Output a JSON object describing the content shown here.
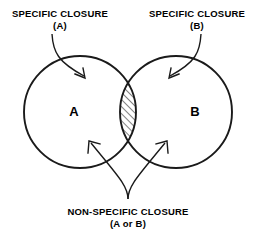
{
  "diagram": {
    "type": "venn-two-set",
    "background_color": "#ffffff",
    "stroke_color": "#1a1a1a",
    "labels": {
      "specific_a_line1": "SPECIFIC CLOSURE",
      "specific_a_line2": "(A)",
      "specific_b_line1": "SPECIFIC CLOSURE",
      "specific_b_line2": "(B)",
      "nonspecific_line1": "NON-SPECIFIC CLOSURE",
      "nonspecific_line2": "(A or B)"
    },
    "sets": {
      "left": {
        "letter": "A",
        "center_x": 80,
        "center_y": 112,
        "radius": 56
      },
      "right": {
        "letter": "B",
        "center_x": 176,
        "center_y": 112,
        "radius": 56
      }
    },
    "intersection": {
      "name": "hatched-lens",
      "fill_pattern": "diagonal-hatch",
      "hatch_color": "#1a1a1a"
    },
    "annotations": [
      {
        "name": "arrow-to-set-a",
        "from_label": "specific_a",
        "points_to": "A"
      },
      {
        "name": "arrow-to-set-b",
        "from_label": "specific_b",
        "points_to": "B"
      },
      {
        "name": "arrow-left-to-union",
        "from_label": "nonspecific",
        "points_to": "A"
      },
      {
        "name": "arrow-right-to-union",
        "from_label": "nonspecific",
        "points_to": "B"
      }
    ]
  }
}
